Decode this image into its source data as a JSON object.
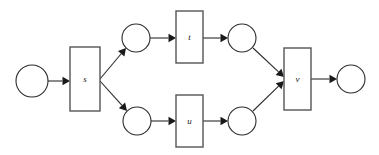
{
  "diagram": {
    "type": "petri-net",
    "title": "",
    "background_color": "#ffffff",
    "stroke_color": "#2b2b2b",
    "transition_stroke_color": "#555555",
    "label_color": "#1a1a1a",
    "places": [
      {
        "id": "p0",
        "label": "",
        "cx": 32,
        "cy": 81,
        "r": 16
      },
      {
        "id": "p1",
        "label": "",
        "cx": 136,
        "cy": 38,
        "r": 14
      },
      {
        "id": "p2",
        "label": "",
        "cx": 242,
        "cy": 38,
        "r": 14
      },
      {
        "id": "p3",
        "label": "",
        "cx": 137,
        "cy": 121,
        "r": 14
      },
      {
        "id": "p4",
        "label": "",
        "cx": 242,
        "cy": 121,
        "r": 14
      },
      {
        "id": "p5",
        "label": "",
        "cx": 351,
        "cy": 79,
        "r": 14
      }
    ],
    "transitions": [
      {
        "id": "s",
        "label": "s",
        "x": 70,
        "y": 47,
        "w": 30,
        "h": 64
      },
      {
        "id": "t",
        "label": "t",
        "x": 176,
        "y": 11,
        "w": 27,
        "h": 52
      },
      {
        "id": "u",
        "label": "u",
        "x": 176,
        "y": 95,
        "w": 27,
        "h": 52
      },
      {
        "id": "v",
        "label": "v",
        "x": 284,
        "y": 48,
        "w": 27,
        "h": 62
      }
    ],
    "arcs": [
      {
        "id": "a0",
        "from": "p0",
        "to": "s",
        "x1": 48,
        "y1": 81,
        "x2": 70,
        "y2": 81
      },
      {
        "id": "a1",
        "from": "s",
        "to": "p1",
        "x1": 100,
        "y1": 79,
        "x2": 126,
        "y2": 48
      },
      {
        "id": "a2",
        "from": "s",
        "to": "p3",
        "x1": 100,
        "y1": 81,
        "x2": 127,
        "y2": 111
      },
      {
        "id": "a3",
        "from": "p1",
        "to": "t",
        "x1": 150,
        "y1": 38,
        "x2": 176,
        "y2": 38
      },
      {
        "id": "a4",
        "from": "t",
        "to": "p2",
        "x1": 203,
        "y1": 38,
        "x2": 228,
        "y2": 38
      },
      {
        "id": "a5",
        "from": "p3",
        "to": "u",
        "x1": 151,
        "y1": 121,
        "x2": 176,
        "y2": 121
      },
      {
        "id": "a6",
        "from": "u",
        "to": "p4",
        "x1": 203,
        "y1": 121,
        "x2": 228,
        "y2": 121
      },
      {
        "id": "a7",
        "from": "p2",
        "to": "v",
        "x1": 253,
        "y1": 48,
        "x2": 284,
        "y2": 77
      },
      {
        "id": "a8",
        "from": "p4",
        "to": "v",
        "x1": 253,
        "y1": 111,
        "x2": 284,
        "y2": 81
      },
      {
        "id": "a9",
        "from": "v",
        "to": "p5",
        "x1": 311,
        "y1": 79,
        "x2": 337,
        "y2": 79
      }
    ]
  }
}
